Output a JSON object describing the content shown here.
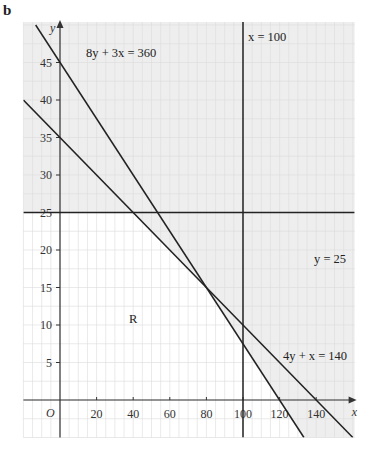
{
  "part_label": "b",
  "chart_data": {
    "type": "line",
    "title": "",
    "xlabel": "x",
    "ylabel": "y",
    "origin_label": "O",
    "xlim": [
      -20,
      161
    ],
    "ylim": [
      -5,
      50.4
    ],
    "grid": true,
    "x_ticks": [
      20,
      40,
      60,
      80,
      100,
      120,
      140
    ],
    "y_ticks": [
      5,
      10,
      15,
      20,
      25,
      30,
      35,
      40,
      45
    ],
    "lines": [
      {
        "name": "8y + 3x = 360",
        "equation": "8y + 3x = 360",
        "points": [
          [
            -13.3,
            50
          ],
          [
            0,
            45
          ],
          [
            120,
            0
          ],
          [
            133.3,
            -5
          ]
        ]
      },
      {
        "name": "4y + x = 140",
        "equation": "4y + x = 140",
        "points": [
          [
            -20,
            40
          ],
          [
            0,
            35
          ],
          [
            140,
            0
          ],
          [
            160,
            -5
          ]
        ]
      },
      {
        "name": "y = 25",
        "equation": "y = 25",
        "points": [
          [
            -20,
            25
          ],
          [
            161,
            25
          ]
        ]
      },
      {
        "name": "x = 100",
        "equation": "x = 100",
        "points": [
          [
            100,
            -5
          ],
          [
            100,
            50.4
          ]
        ]
      }
    ],
    "region_label": "R",
    "region_description": "Unshaded feasible region below y = 25 and below 4y + x = 140 and 8y + 3x = 360",
    "intersections": [
      [
        40,
        25
      ],
      [
        53.3,
        25
      ],
      [
        80,
        15
      ],
      [
        100,
        10
      ],
      [
        100,
        7.5
      ]
    ],
    "shading": {
      "shaded_color": "#eeeeee",
      "region_color": "#ffffff",
      "grid_color": "#dcdcdc"
    }
  },
  "labels": {
    "line1": "8y + 3x = 360",
    "line2": "x = 100",
    "line3": "y = 25",
    "line4": "4y + x = 140",
    "region": "R",
    "x_axis": "x",
    "y_axis": "y",
    "origin": "O"
  }
}
